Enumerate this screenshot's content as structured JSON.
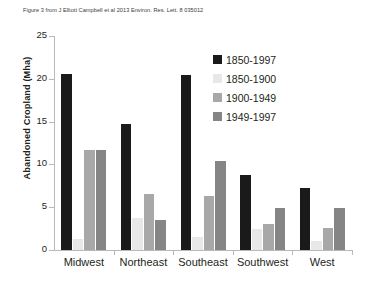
{
  "caption": "Figure 3 from J Elliott Campbell et al 2013 Environ. Res. Lett. 8 035012",
  "colors": {
    "series_1850_1997": "#1a1a1a",
    "series_1850_1900": "#e8e8e8",
    "series_1900_1949": "#a8a8a8",
    "series_1949_1997": "#858585",
    "axis": "#b9b9b9",
    "text": "#231f20",
    "background": "#ffffff"
  },
  "chart_data": {
    "type": "bar",
    "title": "",
    "xlabel": "",
    "ylabel": "Abandoned Cropland (Mha)",
    "ylim": [
      0,
      25
    ],
    "yticks": [
      0,
      5,
      10,
      15,
      20,
      25
    ],
    "ytick_labels": [
      "0",
      "5",
      "10",
      "15",
      "20",
      "25"
    ],
    "grid": false,
    "legend_position": "upper-center-right",
    "categories": [
      "Midwest",
      "Northeast",
      "Southeast",
      "Southwest",
      "West"
    ],
    "series": [
      {
        "name": "1850-1997",
        "color": "#1a1a1a",
        "values": [
          20.6,
          14.7,
          20.5,
          8.8,
          7.2
        ]
      },
      {
        "name": "1850-1900",
        "color": "#e8e8e8",
        "values": [
          1.3,
          3.7,
          1.5,
          2.4,
          1.1
        ]
      },
      {
        "name": "1900-1949",
        "color": "#a8a8a8",
        "values": [
          11.7,
          6.6,
          6.3,
          3.0,
          2.6
        ]
      },
      {
        "name": "1949-1997",
        "color": "#858585",
        "values": [
          11.7,
          3.5,
          10.4,
          4.9,
          4.9
        ]
      }
    ]
  }
}
